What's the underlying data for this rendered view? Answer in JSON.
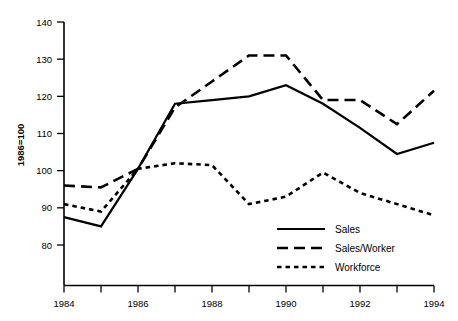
{
  "chart_data": {
    "type": "line",
    "title": "",
    "xlabel": "",
    "ylabel": "1986=100",
    "x": [
      1984,
      1985,
      1986,
      1987,
      1988,
      1989,
      1990,
      1991,
      1992,
      1993,
      1994
    ],
    "xlim": [
      1984,
      1994
    ],
    "ylim": [
      76,
      142
    ],
    "grid": false,
    "legend_position": "bottom-right",
    "xticks": [
      1984,
      1985,
      1986,
      1987,
      1988,
      1989,
      1990,
      1991,
      1992,
      1993,
      1994
    ],
    "xticklabels": [
      "1984",
      "",
      "1986",
      "",
      "1988",
      "",
      "1990",
      "",
      "1992",
      "",
      "1994"
    ],
    "yticks": [
      80,
      90,
      100,
      110,
      120,
      130,
      140
    ],
    "yticklabels": [
      "80",
      "90",
      "100",
      "110",
      "120",
      "130",
      "140"
    ],
    "series": [
      {
        "name": "Sales",
        "style": "solid",
        "values": [
          87.5,
          85.0,
          100.5,
          118.0,
          119.0,
          120.0,
          123.0,
          118.0,
          111.5,
          104.5,
          107.5
        ]
      },
      {
        "name": "Sales/Worker",
        "style": "dashed",
        "values": [
          96.0,
          95.5,
          100.5,
          117.0,
          124.0,
          131.0,
          131.0,
          119.0,
          119.0,
          112.5,
          121.5
        ]
      },
      {
        "name": "Workforce",
        "style": "dotted",
        "values": [
          91.0,
          89.0,
          100.5,
          102.0,
          101.5,
          91.0,
          93.0,
          99.5,
          94.0,
          91.0,
          88.0
        ]
      }
    ]
  },
  "axis": {
    "y_title": "1986=100"
  },
  "legend": {
    "items": [
      {
        "label": "Sales",
        "style": "solid"
      },
      {
        "label": "Sales/Worker",
        "style": "dashed"
      },
      {
        "label": "Workforce",
        "style": "dotted"
      }
    ]
  },
  "artifact": {
    "top_text_fragment": ""
  }
}
